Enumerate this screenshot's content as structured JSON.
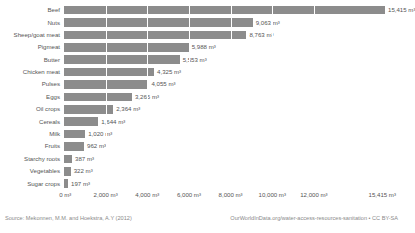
{
  "chart_data": {
    "type": "bar",
    "orientation": "horizontal",
    "title": "",
    "xlabel": "",
    "ylabel": "",
    "unit": "m³",
    "xlim": [
      0,
      15415
    ],
    "grid": true,
    "legend": null,
    "categories": [
      "Beef",
      "Nuts",
      "Sheep/goat meat",
      "Pigmeat",
      "Butter",
      "Chicken meat",
      "Pulses",
      "Eggs",
      "Oil crops",
      "Cereals",
      "Milk",
      "Fruits",
      "Starchy roots",
      "Vegetables",
      "Sugar crops"
    ],
    "values": [
      15415,
      9063,
      8763,
      5988,
      5553,
      4325,
      4055,
      3265,
      2364,
      1644,
      1020,
      962,
      387,
      322,
      197
    ],
    "value_labels": [
      "15,415 m³",
      "9,063 m³",
      "8,763 m³",
      "5,988 m³",
      "5,553 m³",
      "4,325 m³",
      "4,055 m³",
      "3,265 m³",
      "2,364 m³",
      "1,644 m³",
      "1,020 m³",
      "962 m³",
      "387 m³",
      "322 m³",
      "197 m³"
    ],
    "xticks": [
      0,
      2000,
      4000,
      6000,
      8000,
      10000,
      12000,
      15415
    ],
    "xtick_labels": [
      "0 m³",
      "2,000 m³",
      "4,000 m³",
      "6,000 m³",
      "8,000 m³",
      "10,000 m³",
      "12,000 m³",
      "15,415 m³"
    ],
    "bar_color": "#8c8c8c",
    "gridline_color": "#ffffff",
    "text_color": "#555555"
  },
  "footer": {
    "source": "Source: Mekonnen, M.M. and Hoekstra, A.Y (2012)",
    "credit": "OurWorldInData.org/water-access-resources-sanitation • CC BY-SA"
  }
}
